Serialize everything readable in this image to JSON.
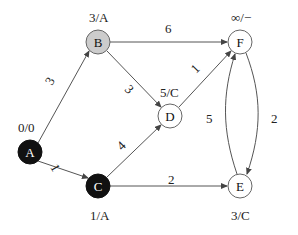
{
  "diagram": {
    "type": "weighted-directed-graph",
    "nodes": [
      {
        "id": "A",
        "label": "A",
        "annotation": "0/0",
        "style": "black"
      },
      {
        "id": "B",
        "label": "B",
        "annotation": "3/A",
        "style": "gray"
      },
      {
        "id": "C",
        "label": "C",
        "annotation": "1/A",
        "style": "black"
      },
      {
        "id": "D",
        "label": "D",
        "annotation": "5/C",
        "style": "white"
      },
      {
        "id": "E",
        "label": "E",
        "annotation": "3/C",
        "style": "white"
      },
      {
        "id": "F",
        "label": "F",
        "annotation": "∞/−",
        "style": "white"
      }
    ],
    "edges": [
      {
        "from": "A",
        "to": "B",
        "weight": "3"
      },
      {
        "from": "A",
        "to": "C",
        "weight": "1"
      },
      {
        "from": "B",
        "to": "F",
        "weight": "6"
      },
      {
        "from": "B",
        "to": "D",
        "weight": "3"
      },
      {
        "from": "C",
        "to": "D",
        "weight": "4"
      },
      {
        "from": "C",
        "to": "E",
        "weight": "2"
      },
      {
        "from": "D",
        "to": "F",
        "weight": "1"
      },
      {
        "from": "E",
        "to": "F",
        "weight": "5"
      },
      {
        "from": "F",
        "to": "E",
        "weight": "2"
      }
    ],
    "colors": {
      "black": "#111111",
      "gray": "#cccccc",
      "white": "#ffffff",
      "stroke": "#555555"
    }
  }
}
